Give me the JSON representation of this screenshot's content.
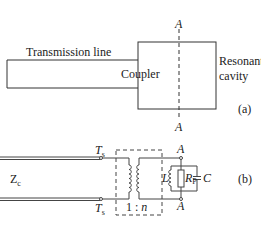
{
  "figure_a": {
    "transmission_line_label": "Transmission line",
    "coupler_label": "Coupler",
    "cavity_label_line1": "Resonant",
    "cavity_label_line2": "cavity",
    "plane_label_top": "A",
    "plane_label_bottom": "A",
    "part_label": "(a)"
  },
  "figure_b": {
    "impedance_label": "Z",
    "impedance_sub": "c",
    "terminal_top": "T",
    "terminal_top_sub": "s",
    "terminal_bottom": "T",
    "terminal_bottom_sub": "s",
    "ratio_label": "1 : n",
    "ratio_1": "1 : ",
    "ratio_n": "n",
    "node_top": "A",
    "node_bottom": "A",
    "inductor_label": "L",
    "resistor_label": "R",
    "resistor_sub": "P",
    "capacitor_label": "C",
    "part_label": "(b)"
  }
}
